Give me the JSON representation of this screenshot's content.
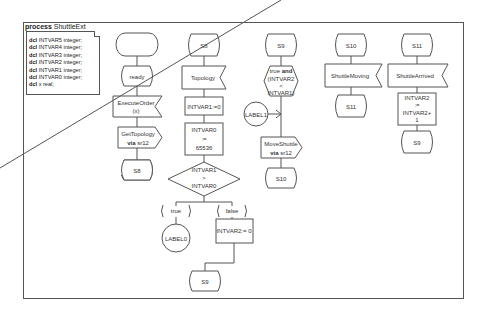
{
  "process": {
    "keyword": "process",
    "name": "ShuttleExt"
  },
  "declarations": [
    {
      "kw": "dcl",
      "text": "INTVAR5 integer;"
    },
    {
      "kw": "dcl",
      "text": "INTVAR4 integer;"
    },
    {
      "kw": "dcl",
      "text": "INTVAR3 integer;"
    },
    {
      "kw": "dcl",
      "text": "INTVAR2 integer;"
    },
    {
      "kw": "dcl",
      "text": "INTVAR1 integer;"
    },
    {
      "kw": "dcl",
      "text": "INTVAR0 integer;"
    },
    {
      "kw": "dcl",
      "text": "x real;"
    }
  ],
  "col1": {
    "start": "",
    "state": "ready",
    "input1": "ExecuteOrder",
    "input1b": "(x)",
    "output1": "GetTopology",
    "via": "via",
    "via_target": "sr12",
    "next_state": "S8"
  },
  "col2": {
    "state": "S8",
    "input": "Topology",
    "task1": "INTVAR1:=0",
    "task2a": "INTVAR0",
    "task2b": ":=",
    "task2c": "65536",
    "decision_a": "INTVAR1",
    "decision_b": ">",
    "decision_c": "INTVAR0",
    "answer_true": "true",
    "answer_false": "false",
    "join_true": "LABEL0",
    "task3": "INTVAR2:= 0",
    "next_state": "S9"
  },
  "col3": {
    "state": "S9",
    "cont_a": "true",
    "cont_and": "and",
    "cont_b": "(INTVAR2",
    "cont_c": "<",
    "cont_d": "INTVAR1)",
    "label": "LABEL1",
    "output": "MoveShuttle",
    "via": "via",
    "via_target": "sr12",
    "next_state": "S10"
  },
  "col4": {
    "state": "S10",
    "input": "ShuttleMoving",
    "next_state": "S11"
  },
  "col5": {
    "state": "S11",
    "input": "ShuttleArrived",
    "task_a": "INTVAR2",
    "task_b": ":=",
    "task_c": "INTVAR2+",
    "task_d": "1",
    "next_state": "S9"
  }
}
